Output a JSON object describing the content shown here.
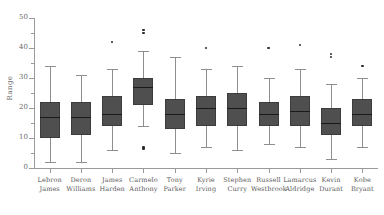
{
  "chart_data": {
    "type": "box",
    "title": "",
    "xlabel": "",
    "ylabel": "Range",
    "ylim": [
      0,
      50
    ],
    "yticks": [
      0,
      10,
      20,
      30,
      40,
      50
    ],
    "ytick_labels": [
      "0",
      "10",
      "20",
      "30",
      "40",
      "50"
    ],
    "grid": false,
    "legend": "none",
    "categories": [
      "Lebron James",
      "Deron Williams",
      "James Harden",
      "Carmelo Anthony",
      "Tony Parker",
      "Kyrie Irving",
      "Stephen Curry",
      "Russell Westbrook",
      "Lamarcus Aldridge",
      "Kevin Durant",
      "Kobe Bryant"
    ],
    "category_lines": [
      [
        "Lebron",
        "James"
      ],
      [
        "Deron",
        "Williams"
      ],
      [
        "James",
        "Harden"
      ],
      [
        "Carmelo",
        "Anthony"
      ],
      [
        "Tony",
        "Parker"
      ],
      [
        "Kyrie",
        "Irving"
      ],
      [
        "Stephen",
        "Curry"
      ],
      [
        "Russell",
        "Westbrook"
      ],
      [
        "Lamarcus",
        "Aldridge"
      ],
      [
        "Kevin",
        "Durant"
      ],
      [
        "Kobe",
        "Bryant"
      ]
    ],
    "boxes": [
      {
        "name": "Lebron James",
        "whisker_low": 2.0,
        "q1": 10.0,
        "median": 17.0,
        "q3": 22.0,
        "whisker_high": 34.0,
        "outliers": []
      },
      {
        "name": "Deron Williams",
        "whisker_low": 2.0,
        "q1": 11.0,
        "median": 17.0,
        "q3": 22.0,
        "whisker_high": 31.0,
        "outliers": []
      },
      {
        "name": "James Harden",
        "whisker_low": 6.0,
        "q1": 14.0,
        "median": 18.0,
        "q3": 24.0,
        "whisker_high": 33.0,
        "outliers": [
          42.0
        ]
      },
      {
        "name": "Carmelo Anthony",
        "whisker_low": 14.0,
        "q1": 21.0,
        "median": 27.0,
        "q3": 30.0,
        "whisker_high": 39.0,
        "outliers": [
          46.0,
          45.0,
          7.0,
          6.5
        ]
      },
      {
        "name": "Tony Parker",
        "whisker_low": 5.0,
        "q1": 13.0,
        "median": 18.0,
        "q3": 23.0,
        "whisker_high": 37.0,
        "outliers": []
      },
      {
        "name": "Kyrie Irving",
        "whisker_low": 7.0,
        "q1": 14.0,
        "median": 20.0,
        "q3": 24.0,
        "whisker_high": 33.0,
        "outliers": [
          40.0
        ]
      },
      {
        "name": "Stephen Curry",
        "whisker_low": 6.0,
        "q1": 14.0,
        "median": 20.0,
        "q3": 25.0,
        "whisker_high": 34.0,
        "outliers": []
      },
      {
        "name": "Russell Westbrook",
        "whisker_low": 8.0,
        "q1": 14.0,
        "median": 18.0,
        "q3": 22.0,
        "whisker_high": 30.0,
        "outliers": [
          40.0
        ]
      },
      {
        "name": "Lamarcus Aldridge",
        "whisker_low": 7.0,
        "q1": 14.0,
        "median": 19.0,
        "q3": 24.0,
        "whisker_high": 33.0,
        "outliers": [
          41.0
        ]
      },
      {
        "name": "Kevin Durant",
        "whisker_low": 3.0,
        "q1": 11.0,
        "median": 15.0,
        "q3": 20.0,
        "whisker_high": 28.0,
        "outliers": [
          38.0,
          37.0
        ]
      },
      {
        "name": "Kobe Bryant",
        "whisker_low": 7.0,
        "q1": 14.0,
        "median": 18.0,
        "q3": 23.0,
        "whisker_high": 30.0,
        "outliers": [
          34.0
        ]
      }
    ],
    "colors": {
      "box_fill": "#4f4f4f",
      "box_edge": "#3c3c3c",
      "median": "#1a1a1a",
      "whisker": "#8e8e8e",
      "outlier": "#2b2b2b",
      "axis": "#9a9a9a",
      "text": "#5a5a5a",
      "background": "#ffffff"
    }
  }
}
